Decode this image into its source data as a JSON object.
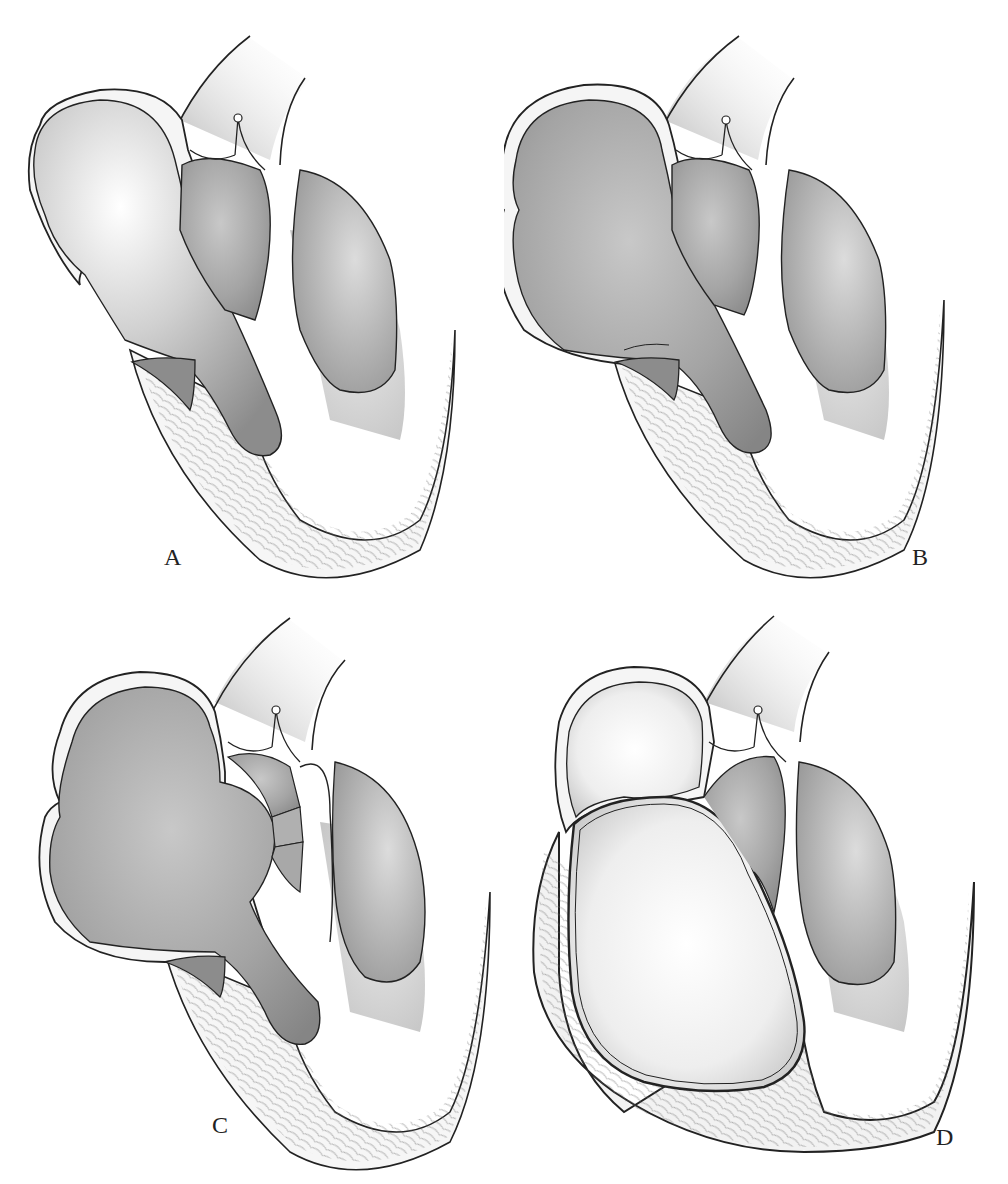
{
  "figure": {
    "type": "anatomical illustration",
    "background": "#ffffff",
    "colors": {
      "outline": "#1a1a1a",
      "wall": "#f4f4f4",
      "cavity_dark": "#8a8a8a",
      "cavity_mid": "#b4b4b4",
      "cavity_light": "#f2f2f2",
      "muscle_hatch": "#555555"
    },
    "panels": [
      {
        "id": "A",
        "label": "A",
        "position": "top-left",
        "variant": "elongated atrium with light upper chamber"
      },
      {
        "id": "B",
        "label": "B",
        "position": "top-right",
        "variant": "bilobed dark atrium"
      },
      {
        "id": "C",
        "label": "C",
        "position": "bottom-left",
        "variant": "bilobed atrium with septal partitions"
      },
      {
        "id": "D",
        "label": "D",
        "position": "bottom-right",
        "variant": "large pale ventricle with thick outer wall"
      }
    ],
    "caption_partial": "(caption text cut off at bottom edge)"
  }
}
